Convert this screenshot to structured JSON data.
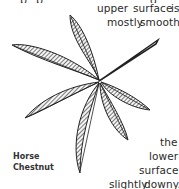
{
  "text": {
    "line1": [
      "upper",
      "surface",
      "is"
    ],
    "line2": [
      "mostly",
      "smooth,"
    ],
    "line3": "the",
    "line4": "lower",
    "line5": "surface",
    "line6": [
      "slightly",
      "downy."
    ]
  },
  "label": {
    "line1": "Horse",
    "line2": "Chestnut"
  },
  "illustration": "horse-chestnut-leaf"
}
